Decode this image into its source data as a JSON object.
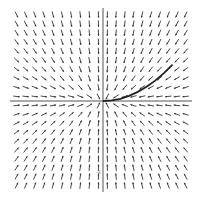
{
  "chart_data": {
    "type": "vector-field",
    "title": "",
    "xlabel": "",
    "ylabel": "",
    "xlim": [
      -5,
      5
    ],
    "ylim": [
      -5,
      5
    ],
    "grid": false,
    "field": {
      "dx": "-x",
      "dy": "-2*y",
      "samples_per_axis": 20
    },
    "trajectory": {
      "description": "solution curve from origin toward upper-right",
      "x": [
        0,
        0.5,
        1,
        1.5,
        2,
        2.5,
        3,
        3.5,
        4
      ],
      "y": [
        0,
        0.03,
        0.12,
        0.28,
        0.5,
        0.78,
        1.12,
        1.53,
        2.0
      ]
    },
    "tick_labels": [
      {
        "axis": "y",
        "value": -4,
        "text": "-4"
      }
    ],
    "colors": {
      "arrow": "#333333",
      "axis": "#555555",
      "curve": "#222222"
    }
  }
}
